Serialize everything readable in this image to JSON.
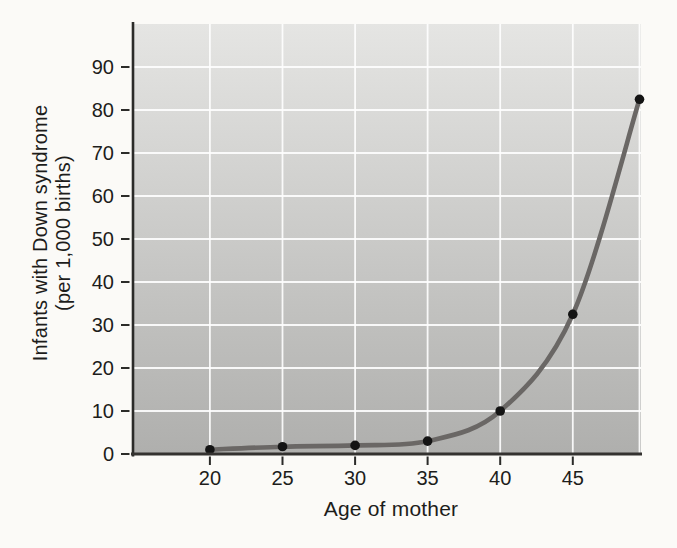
{
  "figure": {
    "xlabel": "Age of mother",
    "ylabel_line1": "Infants with Down syndrome",
    "ylabel_line2": "(per 1,000 births)"
  },
  "chart_data": {
    "type": "line",
    "title": "",
    "xlabel": "Age of mother",
    "ylabel": "Infants with Down syndrome (per 1,000 births)",
    "x": [
      20,
      25,
      30,
      35,
      40,
      45,
      49.6
    ],
    "y": [
      1,
      1.7,
      2,
      3,
      10,
      32.5,
      82.5
    ],
    "x_ticks": [
      20,
      25,
      30,
      35,
      40,
      45
    ],
    "y_ticks": [
      0,
      10,
      20,
      30,
      40,
      50,
      60,
      70,
      80,
      90
    ],
    "xlim": [
      14.7,
      49.7
    ],
    "ylim": [
      0,
      100
    ],
    "grid": true,
    "legend_position": "none",
    "styles": {
      "page_bg": "#fbfaf7",
      "plot_bg_top": "#e5e5e3",
      "plot_bg_bottom": "#afafad",
      "gridline_color": "#ffffff",
      "axis_color": "#343230",
      "tick_color": "#2b2b29",
      "text_color": "#1d1d1b",
      "line_color": "#6a6765",
      "point_color": "#141414"
    }
  }
}
